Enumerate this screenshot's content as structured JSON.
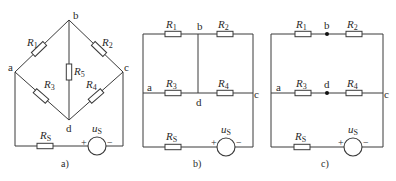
{
  "figure": {
    "panels": [
      {
        "id": "a",
        "caption": "a)",
        "layout": "diamond bridge",
        "nodes": [
          "a",
          "b",
          "c",
          "d"
        ],
        "resistors": [
          {
            "name": "R",
            "sub": "1",
            "between": [
              "a",
              "b"
            ]
          },
          {
            "name": "R",
            "sub": "2",
            "between": [
              "b",
              "c"
            ]
          },
          {
            "name": "R",
            "sub": "3",
            "between": [
              "a",
              "d"
            ]
          },
          {
            "name": "R",
            "sub": "4",
            "between": [
              "d",
              "c"
            ]
          },
          {
            "name": "R",
            "sub": "5",
            "between": [
              "b",
              "d"
            ]
          },
          {
            "name": "R",
            "sub": "S",
            "between": [
              "a",
              "source+"
            ]
          }
        ],
        "source": {
          "name": "u",
          "sub": "S",
          "plus": "+",
          "minus": "−"
        }
      },
      {
        "id": "b",
        "caption": "b)",
        "layout": "rectangular redraw with b–d short",
        "nodes": [
          "a",
          "b",
          "c",
          "d"
        ],
        "resistors": [
          {
            "name": "R",
            "sub": "1"
          },
          {
            "name": "R",
            "sub": "2"
          },
          {
            "name": "R",
            "sub": "3"
          },
          {
            "name": "R",
            "sub": "4"
          },
          {
            "name": "R",
            "sub": "S"
          }
        ],
        "source": {
          "name": "u",
          "sub": "S",
          "plus": "+",
          "minus": "−"
        }
      },
      {
        "id": "c",
        "caption": "c)",
        "layout": "rectangular redraw with b–d open",
        "nodes": [
          "a",
          "b",
          "c",
          "d"
        ],
        "resistors": [
          {
            "name": "R",
            "sub": "1"
          },
          {
            "name": "R",
            "sub": "2"
          },
          {
            "name": "R",
            "sub": "3"
          },
          {
            "name": "R",
            "sub": "4"
          },
          {
            "name": "R",
            "sub": "S"
          }
        ],
        "source": {
          "name": "u",
          "sub": "S",
          "plus": "+",
          "minus": "−"
        }
      }
    ]
  },
  "labels": {
    "node_a": "a",
    "node_b": "b",
    "node_c": "c",
    "node_d": "d",
    "R": "R",
    "u": "u",
    "s1": "1",
    "s2": "2",
    "s3": "3",
    "s4": "4",
    "s5": "5",
    "sS": "S",
    "plus": "+",
    "minus": "−",
    "cap_a": "a)",
    "cap_b": "b)",
    "cap_c": "c)"
  }
}
